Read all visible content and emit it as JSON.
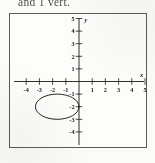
{
  "header": {
    "text": "and 1 vert."
  },
  "figure": {
    "name": "coordinate-plane-with-ellipse",
    "axis_label_x": "x",
    "axis_label_y": "y",
    "ink_color": "#1c1a18",
    "frame_color": "#5c5a56",
    "background": "#fdfdfc"
  },
  "chart_data": {
    "type": "scatter",
    "title": "",
    "xlabel": "x",
    "ylabel": "y",
    "xlim": [
      -5,
      5
    ],
    "ylim": [
      -5,
      5
    ],
    "grid": false,
    "xticks": [
      -4,
      -3,
      -2,
      -1,
      1,
      2,
      3,
      4,
      5
    ],
    "yticks": [
      5,
      4,
      3,
      2,
      1,
      -1,
      -2,
      -3,
      -4
    ],
    "xtick_labels": [
      "-4",
      "-3",
      "-2",
      "-1",
      "1",
      "2",
      "3",
      "4",
      "5"
    ],
    "ytick_labels": [
      "5",
      "4",
      "3",
      "2",
      "1",
      "-1",
      "-2",
      "-3",
      "-4"
    ],
    "series": [
      {
        "name": "ellipse",
        "shape": "ellipse",
        "center": [
          -1.65,
          -2.0
        ],
        "semi_axis_x": 1.65,
        "semi_axis_y": 1.0,
        "x_range": [
          -3.3,
          0.0
        ],
        "y_range": [
          -3.0,
          -1.0
        ],
        "stroke": "#1c1a18",
        "fill": "none"
      }
    ],
    "annotations": []
  }
}
